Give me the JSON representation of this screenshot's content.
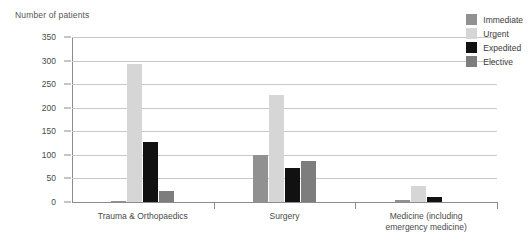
{
  "chart_data": {
    "type": "bar",
    "title": "Number of patients",
    "xlabel": "",
    "ylabel": "Number of patients",
    "ylim": [
      0,
      350
    ],
    "ytick_step": 50,
    "yticks": [
      "0",
      "50",
      "100",
      "150",
      "200",
      "250",
      "300",
      "350"
    ],
    "grid": true,
    "legend_position": "top-right",
    "categories": [
      "Trauma & Orthopaedics",
      "Surgery",
      "Medicine (including\nemergency medicine)"
    ],
    "series": [
      {
        "name": "Immediate",
        "color": "#919191",
        "values": [
          2,
          99,
          5
        ]
      },
      {
        "name": "Urgent",
        "color": "#d6d6d6",
        "values": [
          292,
          227,
          34
        ]
      },
      {
        "name": "Expedited",
        "color": "#111111",
        "values": [
          128,
          73,
          11
        ]
      },
      {
        "name": "Elective",
        "color": "#7d7d7d",
        "values": [
          24,
          86,
          0
        ]
      }
    ]
  },
  "legend": {
    "items": [
      {
        "label": "Immediate",
        "color": "#919191"
      },
      {
        "label": "Urgent",
        "color": "#d6d6d6"
      },
      {
        "label": "Expedited",
        "color": "#111111"
      },
      {
        "label": "Elective",
        "color": "#7d7d7d"
      }
    ]
  },
  "axis": {
    "title": "Number of patients"
  }
}
